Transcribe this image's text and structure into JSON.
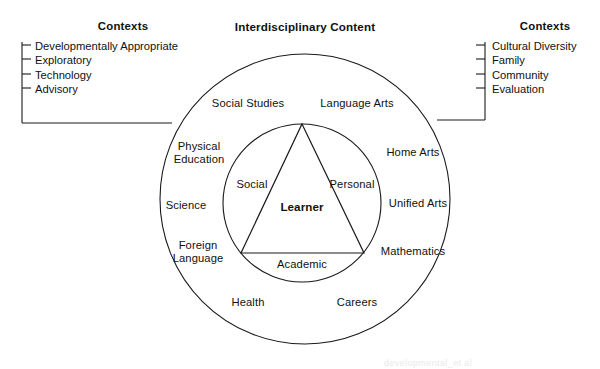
{
  "figure": {
    "title": "Interdisciplinary Content",
    "bottom_artifact": "developmental_et al"
  },
  "contexts_left": {
    "heading": "Contexts",
    "items": [
      "Developmentally Appropriate",
      "Exploratory",
      "Technology",
      "Advisory"
    ]
  },
  "contexts_right": {
    "heading": "Contexts",
    "items": [
      "Cultural Diversity",
      "Family",
      "Community",
      "Evaluation"
    ]
  },
  "outer_ring": {
    "label": "Interdisciplinary Content",
    "subjects": [
      "Social Studies",
      "Language Arts",
      "Physical\nEducation",
      "Home Arts",
      "Science",
      "Unified Arts",
      "Foreign\nLanguage",
      "Mathematics",
      "Health",
      "Careers"
    ]
  },
  "inner_circle": {
    "center_label": "Learner",
    "dimensions": [
      "Social",
      "Personal",
      "Academic"
    ]
  },
  "colors": {
    "stroke": "#1a1a1a",
    "text": "#111111",
    "background": "#ffffff"
  }
}
